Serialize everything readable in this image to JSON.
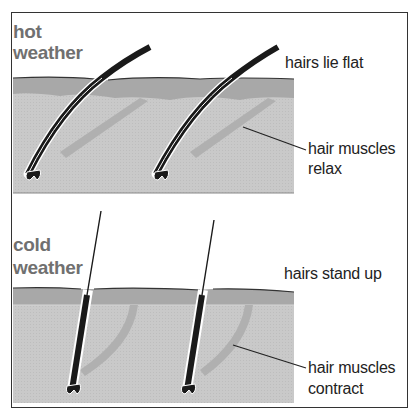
{
  "panels": [
    {
      "title_line1": "hot",
      "title_line2": "weather",
      "hair_label": "hairs lie flat",
      "muscle_label_line1": "hair muscles",
      "muscle_label_line2": "relax"
    },
    {
      "title_line1": "cold",
      "title_line2": "weather",
      "hair_label": "hairs stand up",
      "muscle_label_line1": "hair muscles",
      "muscle_label_line2": "contract"
    }
  ],
  "colors": {
    "skin_surface": "#a8a8a8",
    "skin_lower": "#c9c9c9",
    "muscle": "#b0b0b0",
    "hair": "#1a1a1a",
    "title_text": "#707070"
  }
}
